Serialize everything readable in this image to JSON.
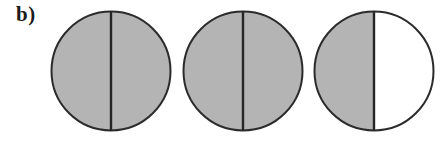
{
  "figure": {
    "panel_label": "b)",
    "width": 443,
    "height": 144,
    "background_color": "#ffffff"
  },
  "style": {
    "shaded_fill": "#b4b4b4",
    "unshaded_fill": "#ffffff",
    "outline_color": "#2b2b2b",
    "divider_color": "#262626",
    "outline_width": 2,
    "divider_width": 2.4
  },
  "chart_data": {
    "type": "diagram",
    "title": "b)",
    "shape": "circle",
    "divider": "vertical-diameter",
    "diameter_px": 122,
    "legend": [
      {
        "key": "shaded",
        "label": "shaded",
        "color": "#b4b4b4"
      },
      {
        "key": "unshaded",
        "label": "unshaded",
        "color": "#ffffff"
      }
    ],
    "items": [
      {
        "index": 1,
        "name": "disc-1",
        "left_half": "shaded",
        "right_half": "shaded",
        "shaded_fraction": 1.0,
        "center_x": 111,
        "center_y": 71
      },
      {
        "index": 2,
        "name": "disc-2",
        "left_half": "shaded",
        "right_half": "shaded",
        "shaded_fraction": 1.0,
        "center_x": 243,
        "center_y": 71
      },
      {
        "index": 3,
        "name": "disc-3",
        "left_half": "shaded",
        "right_half": "unshaded",
        "shaded_fraction": 0.5,
        "center_x": 374,
        "center_y": 71
      }
    ]
  }
}
